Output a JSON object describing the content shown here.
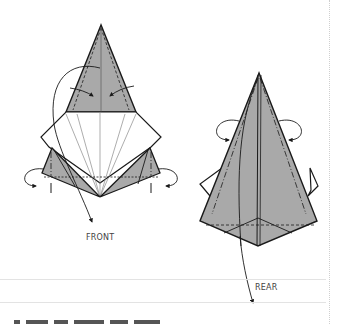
{
  "figures": [
    {
      "id": "front",
      "label": "FRONT",
      "colors": {
        "fill": "#a9a9a9",
        "outline": "#1a1a1a",
        "paper": "#ffffff",
        "crease": "#777777"
      }
    },
    {
      "id": "rear",
      "label": "REAR",
      "colors": {
        "fill": "#a9a9a9",
        "outline": "#1a1a1a"
      }
    }
  ],
  "labels": {
    "front": "FRONT",
    "rear": "REAR"
  },
  "page": {
    "background": "#ffffff",
    "rule_color": "#e3e3e3",
    "margin_line_color": "#cfcfcf"
  }
}
